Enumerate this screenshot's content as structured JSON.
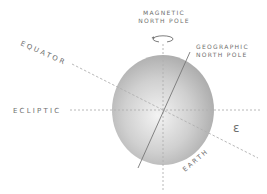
{
  "labels": {
    "magnetic_line1": "MAGNETIC",
    "magnetic_line2": "NORTH POLE",
    "geographic_line1": "GEOGRAPHIC",
    "geographic_line2": "NORTH POLE",
    "equator": "EQUATOR",
    "ecliptic": "ECLIPTIC",
    "earth": "EARTH",
    "obliquity": "ε"
  },
  "colors": {
    "text": "#6e6e6e",
    "sphere_light": "#f2f2f2",
    "sphere_dark": "#a9a9a9",
    "dashed_line": "#b5b5b5",
    "axis_line": "#7a7a7a"
  },
  "icons": {
    "rotation": "rotation-arrow-icon"
  }
}
